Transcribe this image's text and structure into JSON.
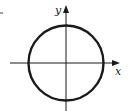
{
  "diagram": {
    "type": "circle-on-axes",
    "labels": {
      "x_axis": "x",
      "y_axis": "y"
    },
    "colors": {
      "stroke": "#1a1a1a",
      "background": "#ffffff"
    }
  }
}
